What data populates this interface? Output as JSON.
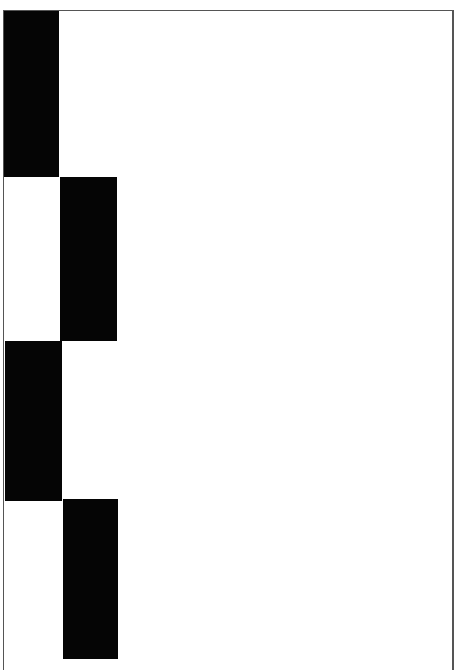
{
  "figure": {
    "frame_color": "#555555",
    "background_color": "#ffffff",
    "block_color": "#050505",
    "blocks": [
      {
        "column": 1,
        "row": 1,
        "left": 0,
        "top": 0,
        "width": 55,
        "height": 166
      },
      {
        "column": 2,
        "row": 2,
        "left": 56,
        "top": 166,
        "width": 57,
        "height": 164
      },
      {
        "column": 1,
        "row": 3,
        "left": 1,
        "top": 330,
        "width": 57,
        "height": 160
      },
      {
        "column": 2,
        "row": 4,
        "left": 59,
        "top": 488,
        "width": 55,
        "height": 160
      }
    ]
  }
}
